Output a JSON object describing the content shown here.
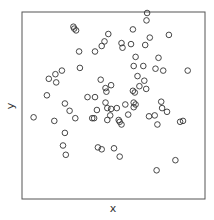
{
  "chart_data": {
    "type": "scatter",
    "title": "",
    "xlabel": "x",
    "ylabel": "y",
    "xlim": [
      0,
      1
    ],
    "ylim": [
      0,
      1
    ],
    "grid": false,
    "legend": null,
    "tick_labels": false,
    "marker": "open-circle",
    "marker_color": "#333333",
    "frame_color": "#555555",
    "points": [
      [
        0.694,
        1.0
      ],
      [
        0.691,
        0.957
      ],
      [
        0.268,
        0.92
      ],
      [
        0.284,
        0.898
      ],
      [
        0.273,
        0.909
      ],
      [
        0.47,
        0.877
      ],
      [
        0.612,
        0.904
      ],
      [
        0.82,
        0.872
      ],
      [
        0.71,
        0.856
      ],
      [
        0.448,
        0.834
      ],
      [
        0.432,
        0.807
      ],
      [
        0.546,
        0.824
      ],
      [
        0.601,
        0.818
      ],
      [
        0.683,
        0.813
      ],
      [
        0.552,
        0.797
      ],
      [
        0.301,
        0.775
      ],
      [
        0.393,
        0.775
      ],
      [
        0.628,
        0.743
      ],
      [
        0.76,
        0.738
      ],
      [
        0.306,
        0.679
      ],
      [
        0.617,
        0.69
      ],
      [
        0.672,
        0.69
      ],
      [
        0.743,
        0.674
      ],
      [
        0.787,
        0.663
      ],
      [
        0.929,
        0.663
      ],
      [
        0.202,
        0.663
      ],
      [
        0.164,
        0.642
      ],
      [
        0.126,
        0.615
      ],
      [
        0.169,
        0.594
      ],
      [
        0.426,
        0.61
      ],
      [
        0.639,
        0.631
      ],
      [
        0.678,
        0.604
      ],
      [
        0.486,
        0.578
      ],
      [
        0.454,
        0.561
      ],
      [
        0.459,
        0.54
      ],
      [
        0.65,
        0.572
      ],
      [
        0.689,
        0.556
      ],
      [
        0.612,
        0.545
      ],
      [
        0.623,
        0.535
      ],
      [
        0.115,
        0.519
      ],
      [
        0.35,
        0.508
      ],
      [
        0.393,
        0.508
      ],
      [
        0.219,
        0.471
      ],
      [
        0.454,
        0.476
      ],
      [
        0.617,
        0.476
      ],
      [
        0.568,
        0.465
      ],
      [
        0.628,
        0.465
      ],
      [
        0.776,
        0.481
      ],
      [
        0.464,
        0.444
      ],
      [
        0.486,
        0.439
      ],
      [
        0.519,
        0.444
      ],
      [
        0.617,
        0.449
      ],
      [
        0.781,
        0.444
      ],
      [
        0.246,
        0.428
      ],
      [
        0.404,
        0.433
      ],
      [
        0.809,
        0.422
      ],
      [
        0.481,
        0.401
      ],
      [
        0.585,
        0.406
      ],
      [
        0.738,
        0.401
      ],
      [
        0.705,
        0.396
      ],
      [
        0.038,
        0.39
      ],
      [
        0.279,
        0.385
      ],
      [
        0.377,
        0.385
      ],
      [
        0.388,
        0.385
      ],
      [
        0.464,
        0.374
      ],
      [
        0.158,
        0.369
      ],
      [
        0.53,
        0.374
      ],
      [
        0.536,
        0.364
      ],
      [
        0.546,
        0.348
      ],
      [
        0.754,
        0.348
      ],
      [
        0.885,
        0.364
      ],
      [
        0.902,
        0.369
      ],
      [
        0.219,
        0.299
      ],
      [
        0.208,
        0.225
      ],
      [
        0.41,
        0.214
      ],
      [
        0.432,
        0.203
      ],
      [
        0.503,
        0.209
      ],
      [
        0.224,
        0.171
      ],
      [
        0.536,
        0.16
      ],
      [
        0.858,
        0.139
      ],
      [
        0.749,
        0.08
      ]
    ]
  }
}
